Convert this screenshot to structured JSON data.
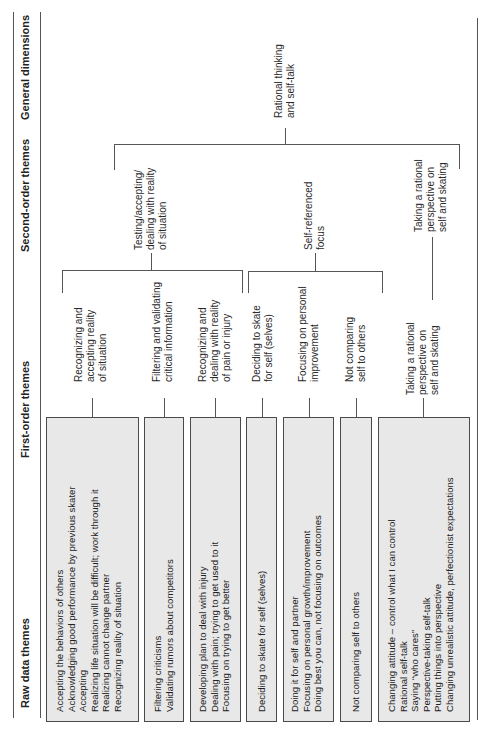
{
  "headers": {
    "raw": "Raw data themes",
    "first": "First-order themes",
    "second": "Second-order themes",
    "general": "General dimensions"
  },
  "general_dimension": "Rational thinking\nand self-talk",
  "second_order": [
    "Testing/accepting/\ndealing with reality\nof situation",
    "Self-referenced\nfocus",
    "Taking a rational\nperspective on\nself and skating"
  ],
  "first_order": [
    "Recognizing and\naccepting reality\nof situation",
    "Filtering and validating\ncritical information",
    "Recognizing and\ndealing with reality\nof pain or injury",
    "Deciding to skate\nfor self (selves)",
    "Focusing on personal\nimprovement",
    "Not comparing\nself to others",
    "Taking a rational\nperspective on\nself and skating"
  ],
  "raw_data": [
    "Accepting the behaviors of others\nAcknowledging good performance by previous skater\nAccepting\nRealizing life situation will be difficult; work through it\nRealizing cannot change partner\nRecognizing reality of situation",
    "Filtering criticisms\nValidating rumors about competitors",
    "Developing plan to deal with injury\nDealing with pain; trying to get used to it\nFocusing on trying to get better",
    "Deciding to skate for self (selves)",
    "Doing it for self and partner\nFocusing on personal growth/improvement\nDoing best you can, not focusing on outcomes",
    "Not comparing self to others",
    "Changing attitude – control what I can control\nRational self-talk\nSaying “who cares”\nPerspective-taking self-talk\nPutting things into perspective\nChanging unrealistic attitude, perfectionist expectations"
  ]
}
